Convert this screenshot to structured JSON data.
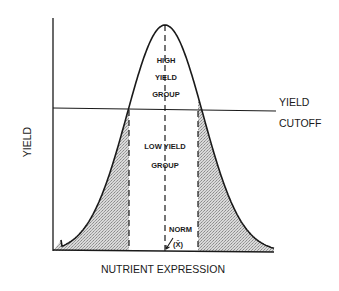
{
  "diagram": {
    "axis_labels": {
      "y": "YIELD",
      "x": "NUTRIENT EXPRESSION"
    },
    "cutoff_label": {
      "line1": "YIELD",
      "line2": "CUTOFF"
    },
    "high_group_label": {
      "line1": "HIGH",
      "line2": "YIELD",
      "line3": "GROUP"
    },
    "low_group_label": {
      "line1": "LOW YIELD",
      "line2": "GROUP"
    },
    "norm_label": {
      "line1": "NORM",
      "line2": "(X̄)"
    },
    "colors": {
      "ink": "#1a1a1a",
      "shading": "#bdbdbd",
      "background": "#ffffff"
    }
  }
}
